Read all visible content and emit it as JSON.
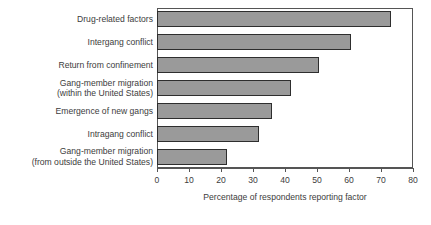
{
  "chart_data": {
    "type": "bar",
    "orientation": "horizontal",
    "title": "",
    "xlabel": "Percentage of respondents reporting factor",
    "ylabel": "",
    "xlim": [
      0,
      80
    ],
    "xticks": [
      0,
      10,
      20,
      30,
      40,
      50,
      60,
      70,
      80
    ],
    "grid": false,
    "legend": null,
    "bar_color": "#9a9a9a",
    "bar_edge_color": "#2e2e2e",
    "categories": [
      "Drug-related factors",
      "Intergang conflict",
      "Return from confinement",
      "Gang-member migration (within the United States)",
      "Emergence of new gangs",
      "Intragang conflict",
      "Gang-member migration (from outside the United States)"
    ],
    "values": [
      73,
      60.5,
      50.5,
      42,
      36,
      32,
      22
    ]
  },
  "labels": {
    "lines": [
      [
        "Drug-related factors"
      ],
      [
        "Intergang conflict"
      ],
      [
        "Return from confinement"
      ],
      [
        "Gang-member migration",
        "(within the United States)"
      ],
      [
        "Emergence of new gangs"
      ],
      [
        "Intragang conflict"
      ],
      [
        "Gang-member migration",
        "(from outside the United States)"
      ]
    ]
  },
  "axis": {
    "tick_labels": [
      "0",
      "10",
      "20",
      "30",
      "40",
      "50",
      "60",
      "70",
      "80"
    ],
    "title": "Percentage of respondents reporting factor"
  }
}
